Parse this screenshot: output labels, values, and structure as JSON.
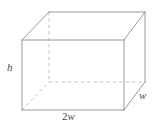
{
  "figure": {
    "name": "rectangular-prism",
    "type": "3d-solid-diagram",
    "background_color": "#ffffff",
    "canvas": {
      "width": 157,
      "height": 130
    },
    "edge_colors": {
      "visible": "#9a9a9a",
      "hidden": "#c2c2c2"
    },
    "label_color": "#4a4a4a"
  },
  "labels": {
    "height": "h",
    "length_prefix": "2",
    "length_var": "w",
    "width": "w"
  },
  "geometry": {
    "front_face": {
      "top_left": [
        22,
        40
      ],
      "top_right": [
        124,
        40
      ],
      "bottom_right": [
        124,
        110
      ],
      "bottom_left": [
        22,
        110
      ]
    },
    "back_face": {
      "top_left": [
        49,
        12
      ],
      "top_right": [
        145,
        12
      ],
      "bottom_right": [
        145,
        82
      ],
      "bottom_left": [
        49,
        82
      ]
    },
    "visible_edges": [
      [
        [
          22,
          40
        ],
        [
          124,
          40
        ]
      ],
      [
        [
          124,
          40
        ],
        [
          124,
          110
        ]
      ],
      [
        [
          124,
          110
        ],
        [
          22,
          110
        ]
      ],
      [
        [
          22,
          110
        ],
        [
          22,
          40
        ]
      ],
      [
        [
          49,
          12
        ],
        [
          145,
          12
        ]
      ],
      [
        [
          145,
          12
        ],
        [
          145,
          82
        ]
      ],
      [
        [
          22,
          40
        ],
        [
          49,
          12
        ]
      ],
      [
        [
          124,
          40
        ],
        [
          145,
          12
        ]
      ],
      [
        [
          124,
          110
        ],
        [
          145,
          82
        ]
      ]
    ],
    "hidden_edges": [
      [
        [
          49,
          12
        ],
        [
          49,
          82
        ]
      ],
      [
        [
          49,
          82
        ],
        [
          145,
          82
        ]
      ],
      [
        [
          22,
          110
        ],
        [
          49,
          82
        ]
      ]
    ]
  }
}
